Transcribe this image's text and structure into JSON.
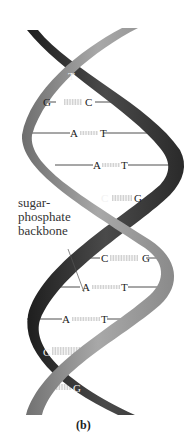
{
  "figure": {
    "caption": "(b)",
    "backbone_label": {
      "line1": "sugar-",
      "line2": "phosphate",
      "line3": "backbone"
    },
    "colors": {
      "dark_strand": "#3a3a3a",
      "light_strand": "#9a9a9a",
      "bond_line": "#222222",
      "background": "#ffffff"
    },
    "base_pairs": [
      {
        "left": "",
        "right": "T",
        "y": 75
      },
      {
        "left": "G",
        "right": "C",
        "y": 102
      },
      {
        "left": "A",
        "right": "T",
        "y": 133
      },
      {
        "left": "A",
        "right": "T",
        "y": 165
      },
      {
        "left": "C",
        "right": "G",
        "y": 198
      },
      {
        "left": "C",
        "right": "G",
        "y": 258
      },
      {
        "left": "A",
        "right": "T",
        "y": 287
      },
      {
        "left": "A",
        "right": "T",
        "y": 319
      },
      {
        "left": "G",
        "right": "",
        "y": 352
      },
      {
        "left": "",
        "right": "G",
        "y": 388
      }
    ]
  }
}
